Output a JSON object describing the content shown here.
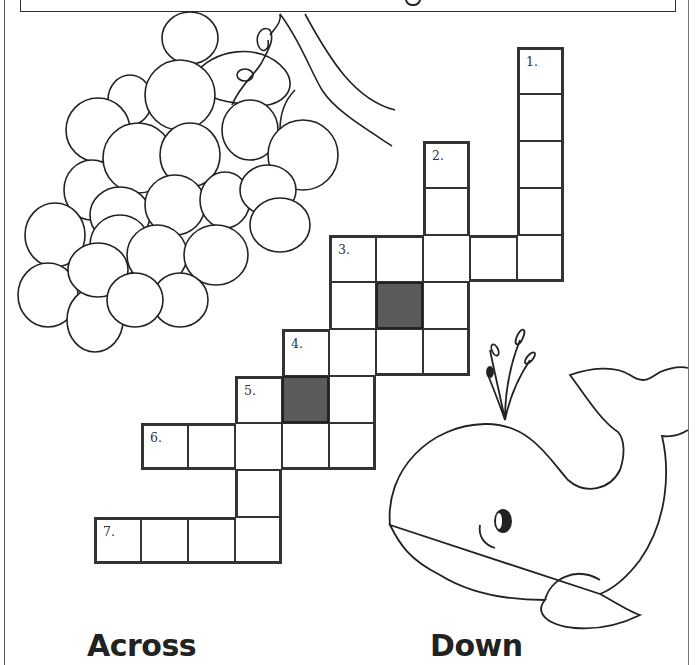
{
  "page": {
    "type": "crossword-worksheet",
    "illustrations": [
      "grapes",
      "whale"
    ]
  },
  "crossword": {
    "cell_size": 47,
    "origin": {
      "x": 94,
      "y": 47
    },
    "cells": [
      {
        "r": 0,
        "c": 9,
        "num": "1."
      },
      {
        "r": 1,
        "c": 9
      },
      {
        "r": 2,
        "c": 9
      },
      {
        "r": 2,
        "c": 7,
        "num": "2."
      },
      {
        "r": 3,
        "c": 9
      },
      {
        "r": 3,
        "c": 7
      },
      {
        "r": 4,
        "c": 5,
        "num": "3."
      },
      {
        "r": 4,
        "c": 6
      },
      {
        "r": 4,
        "c": 7
      },
      {
        "r": 4,
        "c": 8
      },
      {
        "r": 4,
        "c": 9
      },
      {
        "r": 5,
        "c": 5
      },
      {
        "r": 5,
        "c": 6,
        "dark": true
      },
      {
        "r": 5,
        "c": 7
      },
      {
        "r": 6,
        "c": 4,
        "num": "4."
      },
      {
        "r": 6,
        "c": 5
      },
      {
        "r": 6,
        "c": 6
      },
      {
        "r": 6,
        "c": 7
      },
      {
        "r": 7,
        "c": 3,
        "num": "5."
      },
      {
        "r": 7,
        "c": 4,
        "dark": true
      },
      {
        "r": 7,
        "c": 5
      },
      {
        "r": 8,
        "c": 1,
        "num": "6."
      },
      {
        "r": 8,
        "c": 2
      },
      {
        "r": 8,
        "c": 3
      },
      {
        "r": 8,
        "c": 4
      },
      {
        "r": 8,
        "c": 5
      },
      {
        "r": 9,
        "c": 3
      },
      {
        "r": 10,
        "c": 0,
        "num": "7."
      },
      {
        "r": 10,
        "c": 1
      },
      {
        "r": 10,
        "c": 2
      },
      {
        "r": 10,
        "c": 3
      }
    ],
    "clue_numbers": [
      "1.",
      "2.",
      "3.",
      "4.",
      "5.",
      "6.",
      "7."
    ]
  },
  "sections": {
    "across_label": "Across",
    "down_label": "Down"
  }
}
